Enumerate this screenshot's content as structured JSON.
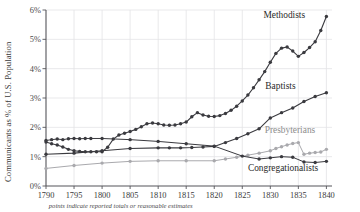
{
  "chart_data": {
    "type": "line",
    "title": "",
    "xlabel": "",
    "ylabel": "Communicants as % of U.S. Population",
    "caption": "points indicate reported totals or reasonable estimates",
    "xlim": [
      1790,
      1841
    ],
    "ylim": [
      0,
      6
    ],
    "grid": true,
    "legend_position": "inline-right-of-series",
    "xticks": [
      "1790",
      "1795",
      "1800",
      "1805",
      "1810",
      "1815",
      "1820",
      "1825",
      "1830",
      "1835",
      "1840"
    ],
    "yticks": [
      "0%",
      "1%",
      "2%",
      "3%",
      "4%",
      "5%",
      "6%"
    ],
    "colors": {
      "dark": "#3a3a3f",
      "light": "#a9a9ad",
      "grid": "#e3e3e6",
      "axis": "#55555a"
    },
    "series": [
      {
        "name": "Methodists",
        "color": "#3a3a3f",
        "label_x": 1836.2,
        "label_y": 5.72,
        "x": [
          1790,
          1791,
          1792,
          1793,
          1794,
          1795,
          1796,
          1797,
          1798,
          1799,
          1800,
          1801,
          1802,
          1803,
          1804,
          1805,
          1806,
          1807,
          1808,
          1809,
          1810,
          1811,
          1812,
          1813,
          1814,
          1815,
          1816,
          1817,
          1818,
          1819,
          1820,
          1821,
          1822,
          1823,
          1824,
          1825,
          1826,
          1827,
          1828,
          1829,
          1830,
          1831,
          1832,
          1833,
          1834,
          1835,
          1836,
          1837,
          1838,
          1839,
          1840
        ],
        "y": [
          1.5,
          1.44,
          1.4,
          1.33,
          1.25,
          1.2,
          1.18,
          1.17,
          1.17,
          1.17,
          1.17,
          1.32,
          1.6,
          1.74,
          1.8,
          1.86,
          1.93,
          2.02,
          2.12,
          2.15,
          2.12,
          2.08,
          2.07,
          2.08,
          2.12,
          2.18,
          2.36,
          2.5,
          2.42,
          2.38,
          2.37,
          2.4,
          2.47,
          2.58,
          2.72,
          2.9,
          3.1,
          3.35,
          3.62,
          3.9,
          4.22,
          4.52,
          4.7,
          4.74,
          4.6,
          4.42,
          4.55,
          4.72,
          4.92,
          5.3,
          5.78
        ]
      },
      {
        "name": "Baptists",
        "color": "#3a3a3f",
        "label_x": 1834.5,
        "label_y": 3.3,
        "x": [
          1790,
          1795,
          1800,
          1805,
          1810,
          1812,
          1814,
          1816,
          1818,
          1820,
          1822,
          1824,
          1826,
          1828,
          1830,
          1832,
          1834,
          1836,
          1838,
          1840
        ],
        "y": [
          1.08,
          1.12,
          1.2,
          1.28,
          1.3,
          1.3,
          1.3,
          1.31,
          1.33,
          1.35,
          1.48,
          1.62,
          1.78,
          1.95,
          2.32,
          2.5,
          2.66,
          2.88,
          3.05,
          3.18
        ]
      },
      {
        "name": "Presbyterians",
        "color": "#a9a9ad",
        "label_x": 1829.0,
        "label_y": 1.82,
        "x": [
          1790,
          1795,
          1800,
          1805,
          1810,
          1815,
          1820,
          1822,
          1824,
          1826,
          1828,
          1830,
          1831,
          1832,
          1833,
          1834,
          1835,
          1836,
          1837,
          1838,
          1839,
          1840
        ],
        "y": [
          0.6,
          0.7,
          0.78,
          0.84,
          0.86,
          0.86,
          0.86,
          0.92,
          0.98,
          1.05,
          1.12,
          1.2,
          1.28,
          1.34,
          1.4,
          1.45,
          1.48,
          1.08,
          1.12,
          1.14,
          1.16,
          1.25
        ]
      },
      {
        "name": "Congregationalists",
        "color": "#3a3a3f",
        "label_x": 1826.0,
        "label_y": 0.52,
        "x": [
          1790,
          1791,
          1792,
          1793,
          1794,
          1795,
          1796,
          1797,
          1798,
          1800,
          1805,
          1810,
          1815,
          1820,
          1825,
          1828,
          1830,
          1832,
          1834,
          1836,
          1838,
          1840
        ],
        "y": [
          1.55,
          1.58,
          1.6,
          1.58,
          1.61,
          1.62,
          1.61,
          1.62,
          1.62,
          1.62,
          1.58,
          1.52,
          1.44,
          1.36,
          1.02,
          0.92,
          0.96,
          1.0,
          0.98,
          0.82,
          0.8,
          0.84
        ]
      }
    ]
  }
}
